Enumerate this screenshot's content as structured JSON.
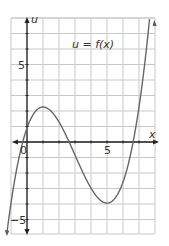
{
  "chart_data": {
    "type": "line",
    "title": "u = f(x)",
    "xlabel": "x",
    "ylabel": "u",
    "xlim": [
      -1,
      8
    ],
    "ylim": [
      -5.9,
      8.1
    ],
    "grid": true,
    "x_ticks": [
      {
        "value": 0,
        "label": "0"
      },
      {
        "value": 5,
        "label": "5"
      }
    ],
    "y_ticks": [
      {
        "value": 5,
        "label": "5"
      },
      {
        "value": -5,
        "label": "-5"
      }
    ],
    "series": [
      {
        "name": "f(x)",
        "x": [
          -1.2,
          -1,
          -0.5,
          0,
          0.5,
          1,
          1.5,
          2,
          2.5,
          3,
          3.5,
          4,
          4.5,
          5,
          5.5,
          6,
          6.5,
          7,
          7.5,
          7.7
        ],
        "values": [
          -5.6,
          -3.9,
          -1.2,
          0.9,
          1.9,
          2.2,
          2.0,
          1.4,
          0.5,
          -0.5,
          -1.6,
          -2.6,
          -3.4,
          -3.9,
          -3.9,
          -3.3,
          -2.1,
          -0.1,
          2.9,
          4.4
        ]
      }
    ],
    "key_points": {
      "local_max": {
        "x": 1,
        "y": 2.2
      },
      "local_min": {
        "x": 5,
        "y": -4
      },
      "u_intercept": 0.9
    }
  }
}
